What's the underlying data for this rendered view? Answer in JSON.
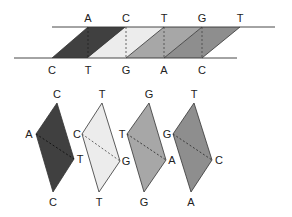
{
  "diagram": {
    "colors": {
      "dark": "#404040",
      "light": "#ececec",
      "mid": "#a7a7a7",
      "midDark": "#8e8e8e",
      "line": "#333333"
    },
    "strands": {
      "top_labels": [
        "A",
        "C",
        "T",
        "G",
        "T"
      ],
      "bottom_labels": [
        "C",
        "T",
        "G",
        "A",
        "C"
      ]
    },
    "units": [
      {
        "top": "C",
        "left": "A",
        "right": "T",
        "bottom": "C",
        "shade": "dark"
      },
      {
        "top": "T",
        "left": "C",
        "right": "G",
        "bottom": "T",
        "shade": "light"
      },
      {
        "top": "G",
        "left": "T",
        "right": "A",
        "bottom": "G",
        "shade": "mid"
      },
      {
        "top": "T",
        "left": "G",
        "right": "C",
        "bottom": "A",
        "shade": "midDark"
      }
    ]
  }
}
